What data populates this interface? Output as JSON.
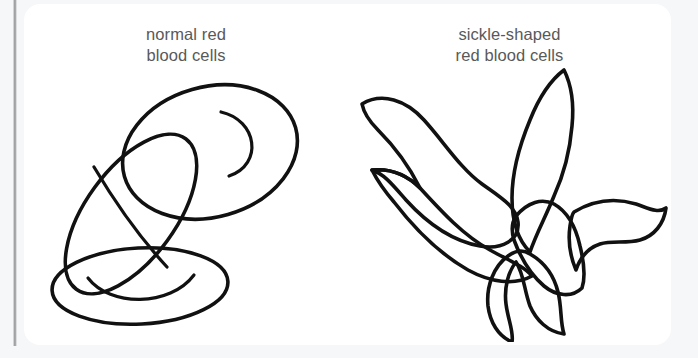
{
  "figure": {
    "background_color": "#f6f7f8",
    "card_color": "#ffffff",
    "rule_color": "#8e9092",
    "outline_color": "#111111",
    "caption_color": "#58595b"
  },
  "panels": [
    {
      "id": "normal",
      "caption": "normal red\nblood cells",
      "caption_line_1": "normal red",
      "caption_line_2": "blood cells",
      "cell_count": 3,
      "cells": [
        {
          "name": "large-oval-cell",
          "description": "large biconcave disc seen face-on, upper right"
        },
        {
          "name": "tilted-oval-cell",
          "description": "elongated disc seen edge-on, tilted, middle left"
        },
        {
          "name": "flat-ellipse-cell",
          "description": "flattened disc seen from above, bottom"
        }
      ]
    },
    {
      "id": "sickle",
      "caption": "sickle-shaped\nred blood cells",
      "caption_line_1": "sickle-shaped",
      "caption_line_2": "red blood cells",
      "cell_count": 4,
      "cells": [
        {
          "name": "sickle-cell-upper-left",
          "description": "crescent arm sweeping to the upper left"
        },
        {
          "name": "sickle-cell-upper-right",
          "description": "crescent arm sweeping to the upper right"
        },
        {
          "name": "sickle-cell-right",
          "description": "crescent arm sweeping to the right"
        },
        {
          "name": "sickle-cell-lower",
          "description": "crescent arm sweeping down and left"
        }
      ]
    }
  ]
}
